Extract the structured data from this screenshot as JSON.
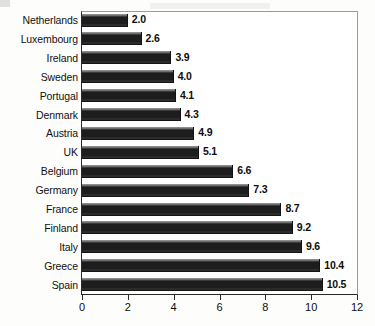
{
  "chart_data": {
    "type": "bar",
    "orientation": "horizontal",
    "title": "",
    "xlabel": "",
    "ylabel": "",
    "xlim": [
      0,
      12
    ],
    "xticks": [
      0,
      2,
      4,
      6,
      8,
      10,
      12
    ],
    "grid": false,
    "legend": false,
    "bar_color": "#1d1d1d",
    "categories": [
      "Netherlands",
      "Luxembourg",
      "Ireland",
      "Sweden",
      "Portugal",
      "Denmark",
      "Austria",
      "UK",
      "Belgium",
      "Germany",
      "France",
      "Finland",
      "Italy",
      "Greece",
      "Spain"
    ],
    "values": [
      2.0,
      2.6,
      3.9,
      4.0,
      4.1,
      4.3,
      4.9,
      5.1,
      6.6,
      7.3,
      8.7,
      9.2,
      9.6,
      10.4,
      10.5
    ],
    "value_labels": [
      "2.0",
      "2.6",
      "3.9",
      "4.0",
      "4.1",
      "4.3",
      "4.9",
      "5.1",
      "6.6",
      "7.3",
      "8.7",
      "9.2",
      "9.6",
      "10.4",
      "10.5"
    ],
    "tick_labels": [
      "0",
      "2",
      "4",
      "6",
      "8",
      "10",
      "12"
    ]
  }
}
